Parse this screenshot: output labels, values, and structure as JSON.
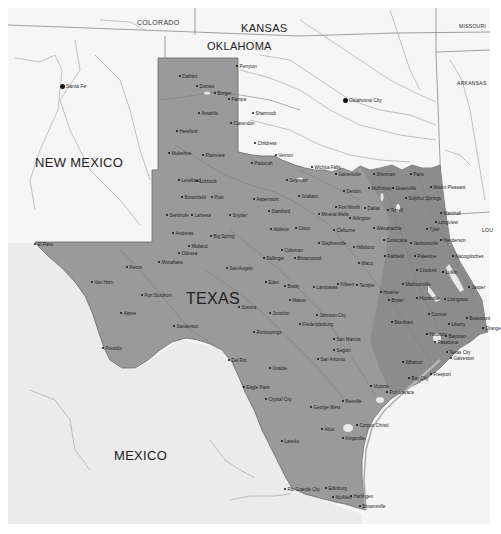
{
  "map": {
    "title": "Texas",
    "colors": {
      "texas_fill": "#9a9a9a",
      "background_fill": "#f4f4f4",
      "mexico_fill": "#ececec",
      "water": "#f4f4f4",
      "border": "#6e6e6e",
      "river": "#8c8c8c"
    },
    "regions": {
      "texas": "TEXAS",
      "new_mexico": "NEW MEXICO",
      "mexico": "MEXICO",
      "oklahoma": "OKLAHOMA",
      "kansas": "KANSAS",
      "colorado": "COLORADO",
      "missouri": "MISSOURI",
      "arkansas": "ARKANSAS",
      "louisiana": "LOU"
    },
    "capitals": [
      {
        "name": "Santa Fe",
        "x": 62,
        "y": 86
      },
      {
        "name": "Oklahoma City",
        "x": 345,
        "y": 100
      }
    ],
    "cities": [
      {
        "name": "Perryton",
        "x": 238,
        "y": 66
      },
      {
        "name": "Dalhart",
        "x": 181,
        "y": 76
      },
      {
        "name": "Dumas",
        "x": 198,
        "y": 86
      },
      {
        "name": "Borger",
        "x": 216,
        "y": 93
      },
      {
        "name": "Pampa",
        "x": 230,
        "y": 99
      },
      {
        "name": "Amarillo",
        "x": 200,
        "y": 113
      },
      {
        "name": "Shamrock",
        "x": 254,
        "y": 113
      },
      {
        "name": "Clarendon",
        "x": 232,
        "y": 123
      },
      {
        "name": "Hereford",
        "x": 178,
        "y": 131
      },
      {
        "name": "Childress",
        "x": 256,
        "y": 143
      },
      {
        "name": "Muleshoe",
        "x": 170,
        "y": 153
      },
      {
        "name": "Plainview",
        "x": 204,
        "y": 155
      },
      {
        "name": "Vernon",
        "x": 277,
        "y": 155
      },
      {
        "name": "Paducah",
        "x": 253,
        "y": 163
      },
      {
        "name": "Wichita Falls",
        "x": 313,
        "y": 167
      },
      {
        "name": "Seymour",
        "x": 288,
        "y": 180
      },
      {
        "name": "Levelland",
        "x": 180,
        "y": 180
      },
      {
        "name": "Lubbock",
        "x": 198,
        "y": 181
      },
      {
        "name": "Brownfield",
        "x": 183,
        "y": 197
      },
      {
        "name": "Post",
        "x": 213,
        "y": 197
      },
      {
        "name": "Aspermont",
        "x": 255,
        "y": 199
      },
      {
        "name": "Graham",
        "x": 300,
        "y": 196
      },
      {
        "name": "Stamford",
        "x": 270,
        "y": 211
      },
      {
        "name": "Mineral Wells",
        "x": 320,
        "y": 214
      },
      {
        "name": "Seminole",
        "x": 168,
        "y": 215
      },
      {
        "name": "Lamesa",
        "x": 193,
        "y": 215
      },
      {
        "name": "Snyder",
        "x": 231,
        "y": 215
      },
      {
        "name": "Abilene",
        "x": 272,
        "y": 229
      },
      {
        "name": "Cisco",
        "x": 297,
        "y": 228
      },
      {
        "name": "Andrews",
        "x": 174,
        "y": 233
      },
      {
        "name": "Big Spring",
        "x": 212,
        "y": 236
      },
      {
        "name": "Midland",
        "x": 190,
        "y": 246
      },
      {
        "name": "Odessa",
        "x": 180,
        "y": 253
      },
      {
        "name": "Monahans",
        "x": 160,
        "y": 262
      },
      {
        "name": "Coleman",
        "x": 283,
        "y": 250
      },
      {
        "name": "Ballinger",
        "x": 265,
        "y": 258
      },
      {
        "name": "Brownwood",
        "x": 296,
        "y": 258
      },
      {
        "name": "San Angelo",
        "x": 228,
        "y": 268
      },
      {
        "name": "Eden",
        "x": 267,
        "y": 282
      },
      {
        "name": "Brady",
        "x": 286,
        "y": 286
      },
      {
        "name": "Lampasas",
        "x": 315,
        "y": 287
      },
      {
        "name": "Killeen",
        "x": 339,
        "y": 284
      },
      {
        "name": "Temple",
        "x": 358,
        "y": 285
      },
      {
        "name": "Gainesville",
        "x": 337,
        "y": 174
      },
      {
        "name": "Sherman",
        "x": 375,
        "y": 174
      },
      {
        "name": "Paris",
        "x": 412,
        "y": 174
      },
      {
        "name": "Denton",
        "x": 345,
        "y": 191
      },
      {
        "name": "McKinney",
        "x": 370,
        "y": 188
      },
      {
        "name": "Greenville",
        "x": 394,
        "y": 188
      },
      {
        "name": "Sulphur Springs",
        "x": 407,
        "y": 198
      },
      {
        "name": "Mount Pleasant",
        "x": 432,
        "y": 187
      },
      {
        "name": "Fort Worth",
        "x": 337,
        "y": 207
      },
      {
        "name": "Dallas",
        "x": 366,
        "y": 208
      },
      {
        "name": "Terrell",
        "x": 389,
        "y": 210
      },
      {
        "name": "Arlington",
        "x": 351,
        "y": 218
      },
      {
        "name": "Marshall",
        "x": 442,
        "y": 213
      },
      {
        "name": "Longview",
        "x": 437,
        "y": 222
      },
      {
        "name": "Tyler",
        "x": 428,
        "y": 229
      },
      {
        "name": "Cleburne",
        "x": 335,
        "y": 230
      },
      {
        "name": "Waxahachie",
        "x": 375,
        "y": 228
      },
      {
        "name": "Corsicana",
        "x": 385,
        "y": 240
      },
      {
        "name": "Jacksonville",
        "x": 412,
        "y": 243
      },
      {
        "name": "Henderson",
        "x": 442,
        "y": 240
      },
      {
        "name": "Stephenville",
        "x": 320,
        "y": 243
      },
      {
        "name": "Hillsboro",
        "x": 355,
        "y": 247
      },
      {
        "name": "Fairfield",
        "x": 386,
        "y": 256
      },
      {
        "name": "Palestine",
        "x": 416,
        "y": 256
      },
      {
        "name": "Nacogdoches",
        "x": 454,
        "y": 256
      },
      {
        "name": "Waco",
        "x": 360,
        "y": 263
      },
      {
        "name": "Crockett",
        "x": 418,
        "y": 270
      },
      {
        "name": "Lufkin",
        "x": 444,
        "y": 272
      },
      {
        "name": "Jasper",
        "x": 470,
        "y": 287
      },
      {
        "name": "Madisonville",
        "x": 404,
        "y": 284
      },
      {
        "name": "Hearne",
        "x": 382,
        "y": 292
      },
      {
        "name": "Bryan",
        "x": 390,
        "y": 300
      },
      {
        "name": "Huntsville",
        "x": 418,
        "y": 298
      },
      {
        "name": "Livingston",
        "x": 446,
        "y": 299
      },
      {
        "name": "Beaumont",
        "x": 468,
        "y": 318
      },
      {
        "name": "Orange",
        "x": 484,
        "y": 328
      },
      {
        "name": "Conroe",
        "x": 430,
        "y": 314
      },
      {
        "name": "Liberty",
        "x": 450,
        "y": 324
      },
      {
        "name": "Brenham",
        "x": 393,
        "y": 322
      },
      {
        "name": "Houston",
        "x": 428,
        "y": 334
      },
      {
        "name": "Baytown",
        "x": 447,
        "y": 336
      },
      {
        "name": "Pasadena",
        "x": 436,
        "y": 342
      },
      {
        "name": "Texas City",
        "x": 448,
        "y": 352
      },
      {
        "name": "Galveston",
        "x": 452,
        "y": 358
      },
      {
        "name": "Wharton",
        "x": 404,
        "y": 362
      },
      {
        "name": "Bay City",
        "x": 410,
        "y": 378
      },
      {
        "name": "Freeport",
        "x": 432,
        "y": 374
      },
      {
        "name": "Victoria",
        "x": 372,
        "y": 386
      },
      {
        "name": "Port Lavaca",
        "x": 388,
        "y": 392
      },
      {
        "name": "El Paso",
        "x": 36,
        "y": 244
      },
      {
        "name": "Pecos",
        "x": 128,
        "y": 267
      },
      {
        "name": "Van Horn",
        "x": 93,
        "y": 282
      },
      {
        "name": "Fort Stockton",
        "x": 143,
        "y": 295
      },
      {
        "name": "Alpine",
        "x": 122,
        "y": 313
      },
      {
        "name": "Sanderson",
        "x": 175,
        "y": 326
      },
      {
        "name": "Presidio",
        "x": 104,
        "y": 348
      },
      {
        "name": "Sonora",
        "x": 240,
        "y": 307
      },
      {
        "name": "Junction",
        "x": 271,
        "y": 313
      },
      {
        "name": "Mason",
        "x": 291,
        "y": 300
      },
      {
        "name": "Johnson City",
        "x": 318,
        "y": 315
      },
      {
        "name": "Fredericksburg",
        "x": 301,
        "y": 324
      },
      {
        "name": "Rocksprings",
        "x": 255,
        "y": 332
      },
      {
        "name": "San Marcos",
        "x": 335,
        "y": 339
      },
      {
        "name": "Seguin",
        "x": 335,
        "y": 350
      },
      {
        "name": "San Antonio",
        "x": 319,
        "y": 359
      },
      {
        "name": "Del Rio",
        "x": 230,
        "y": 360
      },
      {
        "name": "Uvalde",
        "x": 271,
        "y": 368
      },
      {
        "name": "Eagle Pass",
        "x": 245,
        "y": 387
      },
      {
        "name": "Crystal City",
        "x": 267,
        "y": 399
      },
      {
        "name": "Beeville",
        "x": 344,
        "y": 401
      },
      {
        "name": "George West",
        "x": 312,
        "y": 407
      },
      {
        "name": "Corpus Christi",
        "x": 358,
        "y": 425
      },
      {
        "name": "Alice",
        "x": 323,
        "y": 429
      },
      {
        "name": "Kingsville",
        "x": 344,
        "y": 438
      },
      {
        "name": "Laredo",
        "x": 283,
        "y": 441
      },
      {
        "name": "Edinburg",
        "x": 327,
        "y": 488
      },
      {
        "name": "Rio Grande City",
        "x": 286,
        "y": 489
      },
      {
        "name": "Harlingen",
        "x": 352,
        "y": 496
      },
      {
        "name": "McAllen",
        "x": 334,
        "y": 497
      },
      {
        "name": "Brownsville",
        "x": 361,
        "y": 506
      }
    ]
  }
}
